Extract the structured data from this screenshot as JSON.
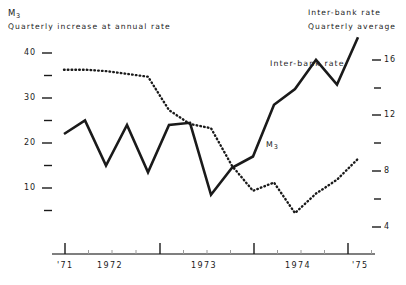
{
  "header": {
    "left_series_symbol": "M",
    "left_series_sub": "3",
    "left_caption": "Quarterly increase at annual rate",
    "right_title": "Inter-bank rate",
    "right_caption": "Quarterly average"
  },
  "inline_labels": {
    "interbank": "Inter-bank rate",
    "m3_symbol": "M",
    "m3_sub": "3"
  },
  "axes": {
    "left_ticks_labeled": [
      "40",
      "30",
      "20",
      "10"
    ],
    "right_ticks_labeled": [
      "16",
      "12",
      "8",
      "4"
    ],
    "year_labels": [
      "'71",
      "1972",
      "1973",
      "1974",
      "'75"
    ]
  },
  "colors": {
    "ink": "#1a1a1a",
    "axis": "#555555",
    "background": "#ffffff"
  },
  "chart_data": {
    "type": "line",
    "title": "",
    "xlabel": "",
    "grid": false,
    "legend": "inline-annotations",
    "x": [
      "1971 Q4",
      "1972 Q1",
      "1972 Q2",
      "1972 Q3",
      "1972 Q4",
      "1973 Q1",
      "1973 Q2",
      "1973 Q3",
      "1973 Q4",
      "1974 Q1",
      "1974 Q2",
      "1974 Q3",
      "1974 Q4",
      "1975 Q1",
      "1975 Q2"
    ],
    "series": [
      {
        "name": "M3",
        "axis": "left",
        "style": "solid",
        "ylabel": "Quarterly increase at annual rate",
        "ylim": [
          5,
          40
        ],
        "yticks": [
          5,
          10,
          15,
          20,
          25,
          30,
          35,
          40
        ],
        "values": [
          23.0,
          20.0,
          30.0,
          21.0,
          31.5,
          21.0,
          20.5,
          36.5,
          30.5,
          28.0,
          16.5,
          13.0,
          6.5,
          12.0,
          1.5
        ]
      },
      {
        "name": "Inter-bank rate",
        "axis": "right",
        "style": "dotted",
        "ylabel": "Quarterly average",
        "ylim": [
          4,
          16
        ],
        "yticks": [
          4,
          6,
          8,
          10,
          12,
          14,
          16
        ],
        "values": [
          4.7,
          4.7,
          4.8,
          5.0,
          5.2,
          7.6,
          8.6,
          8.9,
          11.6,
          13.4,
          12.8,
          15.0,
          13.6,
          12.6,
          11.1
        ]
      }
    ]
  }
}
